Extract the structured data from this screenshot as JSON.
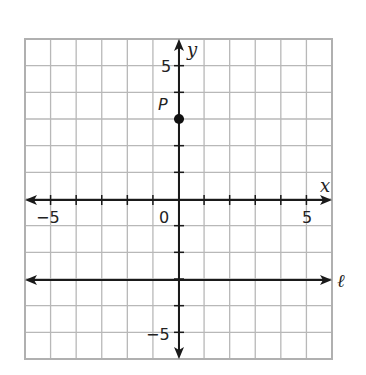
{
  "chart_data": {
    "type": "scatter",
    "title": "",
    "xlabel": "x",
    "ylabel": "y",
    "xlim": [
      -6,
      6
    ],
    "ylim": [
      -6,
      6
    ],
    "grid": true,
    "x_tick_labels": [
      "-5",
      "0",
      "5"
    ],
    "y_tick_labels": [
      "5",
      "-5"
    ],
    "points": [
      {
        "label": "P",
        "x": 0,
        "y": 3
      }
    ],
    "lines": [
      {
        "label": "ℓ",
        "equation": "y = -3",
        "type": "horizontal",
        "y": -3
      }
    ]
  },
  "labels": {
    "x_axis": "x",
    "y_axis": "y",
    "x_neg5": "−5",
    "x_zero": "0",
    "x_pos5": "5",
    "y_pos5": "5",
    "y_neg5": "−5",
    "point_p": "P",
    "line_l": "ℓ"
  },
  "colors": {
    "grid": "#b5b5b5",
    "axis": "#1a1a1a",
    "point": "#111111"
  }
}
